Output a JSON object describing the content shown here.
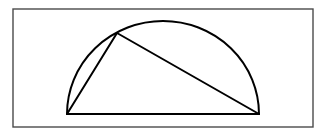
{
  "figure": {
    "elements": [
      {
        "name": "semicircle-arc",
        "type": "arc",
        "label": ""
      },
      {
        "name": "diameter",
        "type": "segment",
        "label": ""
      },
      {
        "name": "chord-left",
        "type": "segment",
        "label": ""
      },
      {
        "name": "chord-right",
        "type": "segment",
        "label": ""
      }
    ],
    "labels": [],
    "colors": {
      "stroke": "#000000",
      "frame": "#4a4a4a",
      "background": "#ffffff"
    }
  }
}
